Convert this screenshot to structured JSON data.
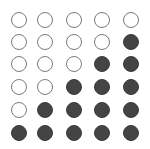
{
  "grid": {
    "rows": 6,
    "cols": 5,
    "colors": {
      "filled": "#444444",
      "outline": "#7a7a7a",
      "background": "#ffffff"
    },
    "col_x": [
      19,
      45,
      74,
      102,
      131
    ],
    "row_y": [
      20,
      42,
      64,
      87,
      110,
      133
    ],
    "cells": [
      [
        0,
        0,
        0,
        0,
        0
      ],
      [
        0,
        0,
        0,
        0,
        1
      ],
      [
        0,
        0,
        0,
        1,
        1
      ],
      [
        0,
        0,
        1,
        1,
        1
      ],
      [
        0,
        1,
        1,
        1,
        1
      ],
      [
        1,
        1,
        1,
        1,
        1
      ]
    ]
  }
}
